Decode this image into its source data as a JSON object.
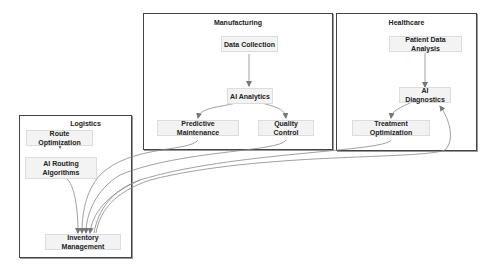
{
  "diagram": {
    "clusters": [
      {
        "id": "manufacturing",
        "title": "Manufacturing"
      },
      {
        "id": "healthcare",
        "title": "Healthcare"
      },
      {
        "id": "logistics",
        "title": "Logistics"
      }
    ],
    "nodes": {
      "data_collection": "Data Collection",
      "ai_analytics": "AI Analytics",
      "predictive_maintenance": "Predictive Maintenance",
      "quality_control": "Quality Control",
      "patient_data_analysis": "Patient Data Analysis",
      "ai_diagnostics": "AI Diagnostics",
      "treatment_optimization": "Treatment Optimization",
      "route_optimization": "Route Optimization",
      "ai_routing_algorithms": "AI Routing Algorithms",
      "inventory_management": "Inventory Management"
    },
    "edges": [
      {
        "from": "Data Collection",
        "to": "AI Analytics"
      },
      {
        "from": "AI Analytics",
        "to": "Predictive Maintenance"
      },
      {
        "from": "AI Analytics",
        "to": "Quality Control"
      },
      {
        "from": "Patient Data Analysis",
        "to": "AI Diagnostics"
      },
      {
        "from": "AI Diagnostics",
        "to": "Treatment Optimization"
      },
      {
        "from": "Route Optimization",
        "to": "AI Routing Algorithms"
      },
      {
        "from": "AI Routing Algorithms",
        "to": "Inventory Management"
      },
      {
        "from": "Predictive Maintenance",
        "to": "Inventory Management"
      },
      {
        "from": "Quality Control",
        "to": "Inventory Management"
      },
      {
        "from": "Treatment Optimization",
        "to": "Inventory Management"
      },
      {
        "from": "Inventory Management",
        "to": "AI Diagnostics"
      },
      {
        "from": "Inventory Management",
        "to": "Inventory Management"
      }
    ],
    "colors": {
      "cluster_border": "#444444",
      "node_fill": "#f3f3f3",
      "node_border": "#dcdcdc",
      "edge": "#777777"
    }
  }
}
